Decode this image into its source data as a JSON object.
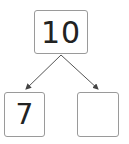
{
  "diagram": {
    "type": "number-bond",
    "whole": {
      "value": "10"
    },
    "parts": [
      {
        "value": "7"
      },
      {
        "value": ""
      }
    ],
    "colors": {
      "border": "#9a9a9a",
      "text": "#222222",
      "arrow": "#444444"
    }
  }
}
